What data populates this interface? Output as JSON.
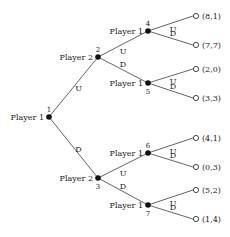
{
  "diagram": {
    "type": "extensive-form game tree",
    "nodes": [
      {
        "id": "1",
        "player": "Player 1",
        "x": 49,
        "y": 117
      },
      {
        "id": "2",
        "player": "Player 2",
        "x": 98,
        "y": 57
      },
      {
        "id": "3",
        "player": "Player 2",
        "x": 98,
        "y": 178
      },
      {
        "id": "4",
        "player": "Player 1",
        "x": 148,
        "y": 31
      },
      {
        "id": "5",
        "player": "Player 1",
        "x": 148,
        "y": 83
      },
      {
        "id": "6",
        "player": "Player 1",
        "x": 148,
        "y": 153
      },
      {
        "id": "7",
        "player": "Player 1",
        "x": 148,
        "y": 205
      }
    ],
    "edges": [
      {
        "from": "1",
        "to": "2",
        "label": "U"
      },
      {
        "from": "1",
        "to": "3",
        "label": "D"
      },
      {
        "from": "2",
        "to": "4",
        "label": "U"
      },
      {
        "from": "2",
        "to": "5",
        "label": "D"
      },
      {
        "from": "3",
        "to": "6",
        "label": "U"
      },
      {
        "from": "3",
        "to": "7",
        "label": "D"
      },
      {
        "from": "4",
        "to": "leaf-1",
        "label": "U"
      },
      {
        "from": "4",
        "to": "leaf-2",
        "label": "D"
      },
      {
        "from": "5",
        "to": "leaf-3",
        "label": "U"
      },
      {
        "from": "5",
        "to": "leaf-4",
        "label": "D"
      },
      {
        "from": "6",
        "to": "leaf-5",
        "label": "U"
      },
      {
        "from": "6",
        "to": "leaf-6",
        "label": "D"
      },
      {
        "from": "7",
        "to": "leaf-7",
        "label": "U"
      },
      {
        "from": "7",
        "to": "leaf-8",
        "label": "D"
      }
    ],
    "leaves": [
      {
        "id": "leaf-1",
        "payoff": "(8,1)",
        "x": 196,
        "y": 16
      },
      {
        "id": "leaf-2",
        "payoff": "(7,7)",
        "x": 196,
        "y": 45
      },
      {
        "id": "leaf-3",
        "payoff": "(2,0)",
        "x": 196,
        "y": 69
      },
      {
        "id": "leaf-4",
        "payoff": "(3,3)",
        "x": 196,
        "y": 98
      },
      {
        "id": "leaf-5",
        "payoff": "(4,1)",
        "x": 196,
        "y": 138
      },
      {
        "id": "leaf-6",
        "payoff": "(0,3)",
        "x": 196,
        "y": 167
      },
      {
        "id": "leaf-7",
        "payoff": "(5,2)",
        "x": 196,
        "y": 190
      },
      {
        "id": "leaf-8",
        "payoff": "(1,4)",
        "x": 196,
        "y": 219
      }
    ]
  }
}
